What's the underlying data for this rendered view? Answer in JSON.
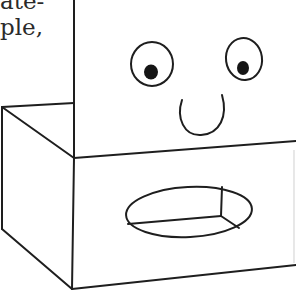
{
  "text_fragment": {
    "lines": [
      "ate-",
      "ple,"
    ]
  },
  "illustration": {
    "subject": "tissue box with a cartoon face",
    "stroke_color": "#1e1e1e",
    "background_color": "#ffffff",
    "parts": {
      "paper_sheet": "face-sheet",
      "left_eye": "eye",
      "right_eye": "eye",
      "mouth": "smile",
      "box": "open box",
      "box_opening": "oval tissue slot"
    }
  }
}
